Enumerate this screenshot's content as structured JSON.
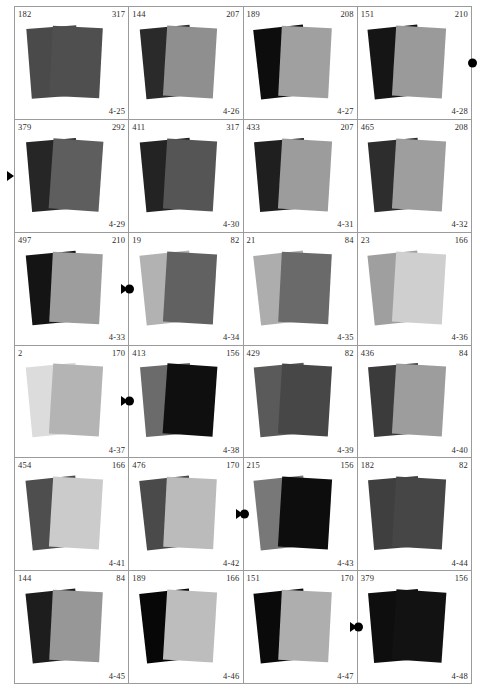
{
  "sheet": {
    "title_id_prefix": "4-",
    "grid": {
      "columns": 4,
      "rows": 6
    },
    "background_color": "#ffffff",
    "border_color": "#9b9b9b",
    "marker_color": "#000000"
  },
  "chart_data": {
    "type": "table",
    "title": "",
    "xlabel": "",
    "ylabel": "",
    "columns": [
      "left_value",
      "right_value",
      "panel_id",
      "back_card_gray",
      "front_card_gray"
    ],
    "categories": [
      "4-25",
      "4-26",
      "4-27",
      "4-28",
      "4-29",
      "4-30",
      "4-31",
      "4-32",
      "4-33",
      "4-34",
      "4-35",
      "4-36",
      "4-37",
      "4-38",
      "4-39",
      "4-40",
      "4-41",
      "4-42",
      "4-43",
      "4-44",
      "4-45",
      "4-46",
      "4-47",
      "4-48"
    ],
    "series": [
      {
        "name": "left_value",
        "values": [
          182,
          144,
          189,
          151,
          379,
          411,
          433,
          465,
          497,
          19,
          21,
          23,
          2,
          413,
          429,
          436,
          454,
          476,
          215,
          182,
          144,
          189,
          151,
          379
        ]
      },
      {
        "name": "right_value",
        "values": [
          317,
          207,
          208,
          210,
          292,
          317,
          207,
          208,
          210,
          82,
          84,
          166,
          170,
          156,
          82,
          84,
          166,
          170,
          156,
          82,
          84,
          166,
          170,
          156
        ]
      }
    ]
  },
  "panels": [
    {
      "id": "4-25",
      "left": "182",
      "right": "317",
      "back": "#4a4a4a",
      "front": "#4f4f4f",
      "dot": false,
      "tri": false
    },
    {
      "id": "4-26",
      "left": "144",
      "right": "207",
      "back": "#2a2a2a",
      "front": "#8f8f8f",
      "dot": false,
      "tri": false
    },
    {
      "id": "4-27",
      "left": "189",
      "right": "208",
      "back": "#0d0d0d",
      "front": "#a0a0a0",
      "dot": false,
      "tri": false
    },
    {
      "id": "4-28",
      "left": "151",
      "right": "210",
      "back": "#151515",
      "front": "#9a9a9a",
      "dot": true,
      "tri": false
    },
    {
      "id": "4-29",
      "left": "379",
      "right": "292",
      "back": "#262626",
      "front": "#5e5e5e",
      "dot": false,
      "tri": true
    },
    {
      "id": "4-30",
      "left": "411",
      "right": "317",
      "back": "#232323",
      "front": "#555555",
      "dot": false,
      "tri": false
    },
    {
      "id": "4-31",
      "left": "433",
      "right": "207",
      "back": "#1f1f1f",
      "front": "#9c9c9c",
      "dot": false,
      "tri": false
    },
    {
      "id": "4-32",
      "left": "465",
      "right": "208",
      "back": "#2d2d2d",
      "front": "#9e9e9e",
      "dot": false,
      "tri": false
    },
    {
      "id": "4-33",
      "left": "497",
      "right": "210",
      "back": "#141414",
      "front": "#9d9d9d",
      "dot": true,
      "tri": false
    },
    {
      "id": "4-34",
      "left": "19",
      "right": "82",
      "back": "#b2b2b2",
      "front": "#616161",
      "dot": false,
      "tri": true
    },
    {
      "id": "4-35",
      "left": "21",
      "right": "84",
      "back": "#adadad",
      "front": "#6a6a6a",
      "dot": false,
      "tri": false
    },
    {
      "id": "4-36",
      "left": "23",
      "right": "166",
      "back": "#9f9f9f",
      "front": "#cfcfcf",
      "dot": false,
      "tri": false
    },
    {
      "id": "4-37",
      "left": "2",
      "right": "170",
      "back": "#dcdcdc",
      "front": "#b4b4b4",
      "dot": true,
      "tri": false
    },
    {
      "id": "4-38",
      "left": "413",
      "right": "156",
      "back": "#6b6b6b",
      "front": "#0f0f0f",
      "dot": false,
      "tri": true
    },
    {
      "id": "4-39",
      "left": "429",
      "right": "82",
      "back": "#5a5a5a",
      "front": "#474747",
      "dot": false,
      "tri": false
    },
    {
      "id": "4-40",
      "left": "436",
      "right": "84",
      "back": "#3b3b3b",
      "front": "#9d9d9d",
      "dot": false,
      "tri": false
    },
    {
      "id": "4-41",
      "left": "454",
      "right": "166",
      "back": "#4e4e4e",
      "front": "#cbcbcb",
      "dot": false,
      "tri": false
    },
    {
      "id": "4-42",
      "left": "476",
      "right": "170",
      "back": "#4a4a4a",
      "front": "#bbbbbb",
      "dot": true,
      "tri": false
    },
    {
      "id": "4-43",
      "left": "215",
      "right": "156",
      "back": "#787878",
      "front": "#0d0d0d",
      "dot": false,
      "tri": true
    },
    {
      "id": "4-44",
      "left": "182",
      "right": "82",
      "back": "#3f3f3f",
      "front": "#464646",
      "dot": false,
      "tri": false
    },
    {
      "id": "4-45",
      "left": "144",
      "right": "84",
      "back": "#1d1d1d",
      "front": "#979797",
      "dot": false,
      "tri": false
    },
    {
      "id": "4-46",
      "left": "189",
      "right": "166",
      "back": "#070707",
      "front": "#bdbdbd",
      "dot": false,
      "tri": false
    },
    {
      "id": "4-47",
      "left": "151",
      "right": "170",
      "back": "#0a0a0a",
      "front": "#aeaeae",
      "dot": true,
      "tri": false
    },
    {
      "id": "4-48",
      "left": "379",
      "right": "156",
      "back": "#0e0e0e",
      "front": "#121212",
      "dot": false,
      "tri": true
    }
  ]
}
